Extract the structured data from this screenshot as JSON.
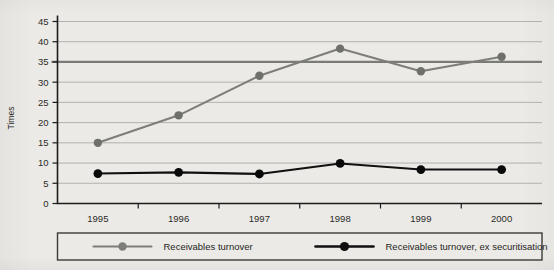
{
  "chart_data": {
    "type": "line",
    "title": "",
    "xlabel": "",
    "ylabel": "Times",
    "categories": [
      "1995",
      "1996",
      "1997",
      "1998",
      "1999",
      "2000"
    ],
    "x": [
      1995,
      1996,
      1997,
      1998,
      1999,
      2000
    ],
    "ylim": [
      0,
      45
    ],
    "ytick_values": [
      0,
      5,
      10,
      15,
      20,
      25,
      30,
      35,
      40,
      45
    ],
    "ytick_labels": [
      "0",
      "5",
      "10",
      "15",
      "20",
      "25",
      "30",
      "35",
      "40",
      "45"
    ],
    "grid": true,
    "grid_orientation": "horizontal",
    "legend_position": "bottom",
    "reference_line": {
      "value": 35,
      "color": "#7b7b78",
      "orientation": "horizontal"
    },
    "series": [
      {
        "name": "Receivables turnover",
        "color": "#7d7d7a",
        "marker": "circle",
        "values": [
          15.0,
          21.8,
          31.6,
          38.3,
          32.7,
          36.3
        ]
      },
      {
        "name": "Receivables turnover, ex securitisation",
        "color": "#101010",
        "marker": "circle",
        "values": [
          7.4,
          7.7,
          7.3,
          9.9,
          8.4,
          8.4
        ]
      }
    ]
  },
  "legend": {
    "entries": [
      {
        "label": "Receivables turnover",
        "color": "#7d7d7a"
      },
      {
        "label": "Receivables turnover, ex securitisation",
        "color": "#101010"
      }
    ]
  },
  "colors": {
    "background": "#eceae6",
    "axis": "#1c1c1c",
    "grid": "#9a9a96",
    "series_gray": "#7d7d7a",
    "series_black": "#101010",
    "reference": "#7b7b78"
  }
}
